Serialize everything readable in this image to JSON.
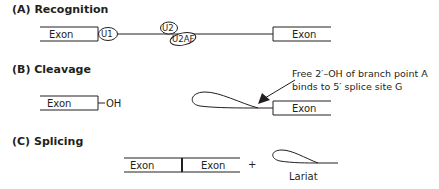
{
  "panels": [
    {
      "title": "(A) Recognition",
      "exon_left": "Exon",
      "exon_right": "Exon",
      "factors": [
        "U1",
        "U2",
        "U2AF"
      ]
    },
    {
      "title": "(B) Cleavage",
      "exon_left": "Exon",
      "hydroxyl": "OH",
      "exon_right": "Exon",
      "annotation_line1": "Free 2′–OH of branch point A",
      "annotation_line2": "binds to 5′ splice site G"
    },
    {
      "title": "(C) Splicing",
      "exon_left": "Exon",
      "exon_right": "Exon",
      "plus": "+",
      "lariat_label": "Lariat"
    }
  ],
  "colors": {
    "ink": "#231f20",
    "background": "#ffffff"
  }
}
